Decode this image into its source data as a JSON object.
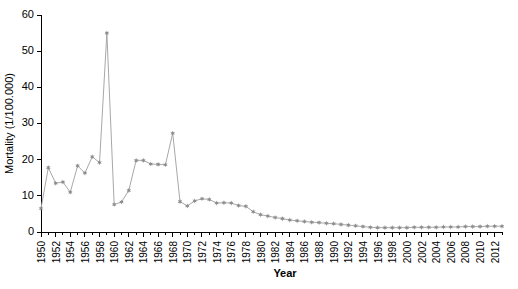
{
  "chart_data": {
    "type": "line",
    "title": "",
    "xlabel": "Year",
    "ylabel": "Mortality (1/100.000)",
    "xlim": [
      1950,
      2013
    ],
    "ylim": [
      0,
      60
    ],
    "yticks": [
      0,
      10,
      20,
      30,
      40,
      50,
      60
    ],
    "ytick_labels": [
      "0",
      "10",
      "20",
      "30",
      "40",
      "50",
      "60"
    ],
    "xticks": [
      1950,
      1952,
      1954,
      1956,
      1958,
      1960,
      1962,
      1964,
      1966,
      1968,
      1970,
      1972,
      1974,
      1976,
      1978,
      1980,
      1982,
      1984,
      1986,
      1988,
      1990,
      1992,
      1994,
      1996,
      1998,
      2000,
      2002,
      2004,
      2006,
      2008,
      2010,
      2012
    ],
    "xtick_labels": [
      "1950",
      "1952",
      "1954",
      "1956",
      "1958",
      "1960",
      "1962",
      "1964",
      "1966",
      "1968",
      "1970",
      "1972",
      "1974",
      "1976",
      "1978",
      "1980",
      "1982",
      "1984",
      "1986",
      "1988",
      "1990",
      "1992",
      "1994",
      "1996",
      "1998",
      "2000",
      "2002",
      "2004",
      "2006",
      "2008",
      "2010",
      "2012"
    ],
    "grid": false,
    "legend": false,
    "marker": "star",
    "line_color": "#a8a8a8",
    "marker_color": "#8c8c8c",
    "x": [
      1950,
      1951,
      1952,
      1953,
      1954,
      1955,
      1956,
      1957,
      1958,
      1959,
      1960,
      1961,
      1962,
      1963,
      1964,
      1965,
      1966,
      1967,
      1968,
      1969,
      1970,
      1971,
      1972,
      1973,
      1974,
      1975,
      1976,
      1977,
      1978,
      1979,
      1980,
      1981,
      1982,
      1983,
      1984,
      1985,
      1986,
      1987,
      1988,
      1989,
      1990,
      1991,
      1992,
      1993,
      1994,
      1995,
      1996,
      1997,
      1998,
      1999,
      2000,
      2001,
      2002,
      2003,
      2004,
      2005,
      2006,
      2007,
      2008,
      2009,
      2010,
      2011,
      2012,
      2013
    ],
    "values": [
      6.5,
      17.8,
      13.5,
      13.8,
      11.0,
      18.3,
      16.3,
      20.8,
      19.2,
      55.0,
      7.6,
      8.3,
      11.5,
      19.8,
      19.8,
      18.8,
      18.7,
      18.6,
      27.3,
      8.4,
      7.2,
      8.6,
      9.2,
      9.0,
      8.0,
      8.1,
      8.0,
      7.3,
      7.1,
      5.6,
      4.8,
      4.4,
      4.0,
      3.7,
      3.3,
      3.1,
      2.9,
      2.7,
      2.6,
      2.4,
      2.3,
      2.1,
      1.9,
      1.7,
      1.5,
      1.3,
      1.2,
      1.2,
      1.2,
      1.2,
      1.2,
      1.3,
      1.3,
      1.3,
      1.3,
      1.4,
      1.4,
      1.4,
      1.5,
      1.5,
      1.5,
      1.6,
      1.6,
      1.6
    ],
    "series": [
      {
        "name": "Mortality",
        "values": [
          6.5,
          17.8,
          13.5,
          13.8,
          11.0,
          18.3,
          16.3,
          20.8,
          19.2,
          55.0,
          7.6,
          8.3,
          11.5,
          19.8,
          19.8,
          18.8,
          18.7,
          18.6,
          27.3,
          8.4,
          7.2,
          8.6,
          9.2,
          9.0,
          8.0,
          8.1,
          8.0,
          7.3,
          7.1,
          5.6,
          4.8,
          4.4,
          4.0,
          3.7,
          3.3,
          3.1,
          2.9,
          2.7,
          2.6,
          2.4,
          2.3,
          2.1,
          1.9,
          1.7,
          1.5,
          1.3,
          1.2,
          1.2,
          1.2,
          1.2,
          1.2,
          1.3,
          1.3,
          1.3,
          1.3,
          1.4,
          1.4,
          1.4,
          1.5,
          1.5,
          1.5,
          1.6,
          1.6,
          1.6
        ]
      }
    ]
  }
}
